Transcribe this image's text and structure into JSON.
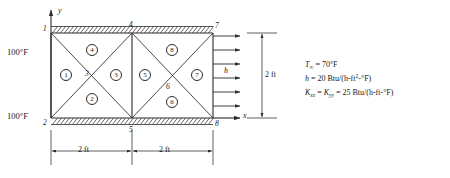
{
  "figure": {
    "axes": {
      "y_label": "y",
      "x_label": "x"
    },
    "boundary_conditions": {
      "left_top_temp": "100°F",
      "left_bottom_temp": "100°F",
      "convection_symbol": "h"
    },
    "nodes": [
      {
        "id": "1",
        "label": "1"
      },
      {
        "id": "2",
        "label": "2"
      },
      {
        "id": "3",
        "label": "3"
      },
      {
        "id": "4",
        "label": "4"
      },
      {
        "id": "5",
        "label": "5"
      },
      {
        "id": "6",
        "label": "6"
      },
      {
        "id": "7",
        "label": "7"
      },
      {
        "id": "8",
        "label": "8"
      }
    ],
    "elements": [
      {
        "id": "1",
        "label": "1"
      },
      {
        "id": "2",
        "label": "2"
      },
      {
        "id": "3",
        "label": "3"
      },
      {
        "id": "4",
        "label": "4"
      },
      {
        "id": "5",
        "label": "5"
      },
      {
        "id": "6",
        "label": "6"
      },
      {
        "id": "7",
        "label": "7"
      },
      {
        "id": "8",
        "label": "8"
      }
    ],
    "dimensions": {
      "bottom_left": "2 ft",
      "bottom_right": "2 ft",
      "right_height": "2 ft"
    }
  },
  "properties": {
    "ambient_temp_symbol": "T",
    "ambient_temp_subscript": "∞",
    "ambient_temp_value": "= 70°F",
    "convection_symbol": "h",
    "convection_value": "= 20 Btu/(h-ft",
    "convection_exp": "2",
    "convection_tail": "-°F)",
    "conductivity_symbol_x": "K",
    "conductivity_sub_x": "xx",
    "conductivity_eq": "=",
    "conductivity_symbol_y": "K",
    "conductivity_sub_y": "yy",
    "conductivity_value": "= 25 Btu/(h-ft-°F)"
  },
  "colors": {
    "line": "#2b2b2b",
    "hatch": "#3a3a3a",
    "text": "#1a1a1a",
    "background": "#ffffff"
  }
}
